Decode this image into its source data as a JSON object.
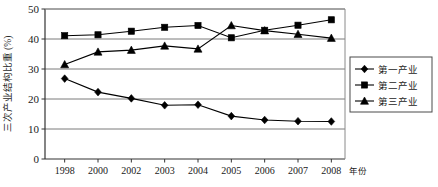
{
  "chart_data": {
    "type": "line",
    "title": "",
    "xlabel": "年份",
    "ylabel": "三次产业结构比重 (%)",
    "categories": [
      "1998",
      "2000",
      "2002",
      "2003",
      "2004",
      "2005",
      "2006",
      "2007",
      "2008"
    ],
    "ylim": [
      0,
      50
    ],
    "yticks": [
      "0",
      "10",
      "20",
      "30",
      "40",
      "50"
    ],
    "ytick_values": [
      0,
      10,
      20,
      30,
      40,
      50
    ],
    "grid": true,
    "grid_axis": "y",
    "legend_position": "right",
    "series": [
      {
        "name": "第一产业",
        "marker": "diamond",
        "color": "#000000",
        "values": [
          26.8,
          22.3,
          20.2,
          17.9,
          18.1,
          14.3,
          13.0,
          12.6,
          12.5
        ]
      },
      {
        "name": "第二产业",
        "marker": "square",
        "color": "#000000",
        "values": [
          41.1,
          41.4,
          42.6,
          43.9,
          44.5,
          40.4,
          42.9,
          44.6,
          46.4
        ]
      },
      {
        "name": "第三产业",
        "marker": "triangle",
        "color": "#000000",
        "values": [
          31.5,
          35.7,
          36.3,
          37.7,
          36.7,
          44.5,
          42.8,
          41.6,
          40.3
        ]
      }
    ]
  },
  "legend": {
    "items": [
      {
        "label": "第一产业"
      },
      {
        "label": "第二产业"
      },
      {
        "label": "第三产业"
      }
    ]
  }
}
